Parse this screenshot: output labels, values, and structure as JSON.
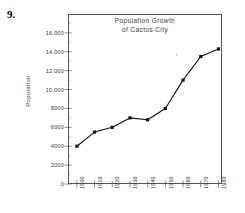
{
  "problem": {
    "number": "9."
  },
  "chart_data": {
    "type": "line",
    "title": "Population Growth of Cactus City",
    "title_lines": [
      "Population Growth",
      "of Cactus City"
    ],
    "xlabel": "",
    "ylabel": "Population",
    "categories": [
      "1900",
      "1910",
      "1920",
      "1930",
      "1940",
      "1950",
      "1960",
      "1970",
      "1980"
    ],
    "x": [
      1900,
      1910,
      1920,
      1930,
      1940,
      1950,
      1960,
      1970,
      1980
    ],
    "values": [
      4000,
      5500,
      6000,
      7000,
      6800,
      8000,
      11000,
      13500,
      14300
    ],
    "series": [
      {
        "name": "Population",
        "values": [
          4000,
          5500,
          6000,
          7000,
          6800,
          8000,
          11000,
          13500,
          14300
        ]
      }
    ],
    "ylim": [
      0,
      18000
    ],
    "xlim": [
      1895,
      1982
    ],
    "ytick_values": [
      0,
      2000,
      4000,
      6000,
      8000,
      10000,
      12000,
      14000,
      16000
    ],
    "ytick_labels": [
      "0",
      "2000",
      "4000",
      "6000",
      "8000",
      "10,000",
      "12,000",
      "14,000",
      "16,000"
    ],
    "yminor_step": 1000,
    "grid": false,
    "legend": false,
    "legend_position": "none",
    "marker": "square",
    "line_color": "#111111",
    "axis_color": "#555555",
    "text_color": "#3a3a3a"
  }
}
